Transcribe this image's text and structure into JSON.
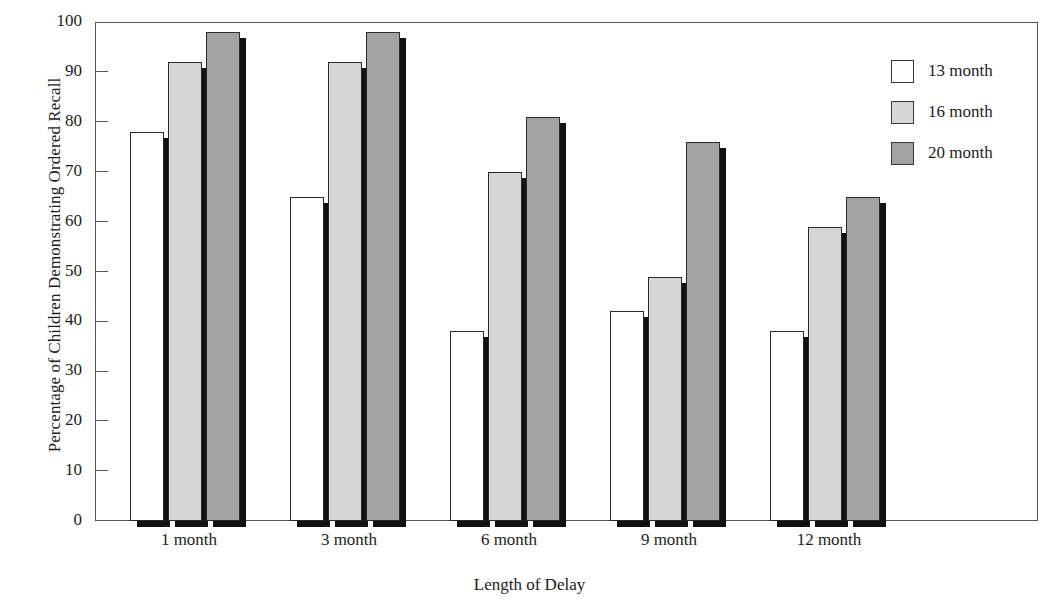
{
  "chart_data": {
    "type": "bar",
    "title": "",
    "xlabel": "Length of Delay",
    "ylabel": "Percentage of Children Demonstrating Ordered Recall",
    "categories": [
      "1 month",
      "3 month",
      "6 month",
      "9 month",
      "12 month"
    ],
    "series": [
      {
        "name": "13 month",
        "color": "#ffffff",
        "values": [
          78,
          65,
          38,
          42,
          38
        ]
      },
      {
        "name": "16 month",
        "color": "#d6d6d6",
        "values": [
          92,
          92,
          70,
          49,
          59
        ]
      },
      {
        "name": "20 month",
        "color": "#a2a2a2",
        "values": [
          98,
          98,
          81,
          76,
          65
        ]
      }
    ],
    "ylim": [
      0,
      100
    ],
    "y_ticks": [
      0,
      10,
      20,
      30,
      40,
      50,
      60,
      70,
      80,
      90,
      100
    ],
    "y_tick_labels": [
      "0",
      "10",
      "20",
      "30",
      "40",
      "50",
      "60",
      "70",
      "80",
      "90",
      "100"
    ],
    "grid": false,
    "legend_position": "top-right",
    "legend_entries": [
      "13 month",
      "16 month",
      "20 month"
    ],
    "bar_style": "3d-shadow",
    "frame": "box"
  },
  "axes": {
    "y_title": "Percentage of Children Demonstrating Ordered Recall",
    "x_title": "Length of Delay"
  },
  "colors": {
    "series_13_month": "#ffffff",
    "series_16_month": "#d6d6d6",
    "series_20_month": "#a2a2a2",
    "bar_outline": "#2a2a2a",
    "bar_shadow": "#111111",
    "frame": "#555555",
    "text": "#1c1c1c",
    "background": "#ffffff"
  }
}
